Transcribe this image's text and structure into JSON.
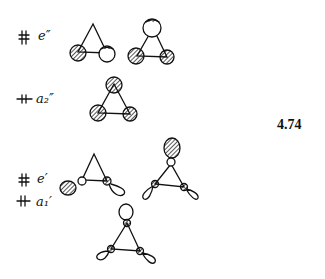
{
  "figure": {
    "number": "4.74",
    "levels": [
      {
        "electrons": "paired",
        "symmetry_label": "e″"
      },
      {
        "electrons": "paired",
        "symmetry_label": "a₂″"
      },
      {
        "electrons": "paired",
        "symmetry_label": "e′"
      },
      {
        "electrons": "paired",
        "symmetry_label": "a₁′"
      }
    ]
  }
}
